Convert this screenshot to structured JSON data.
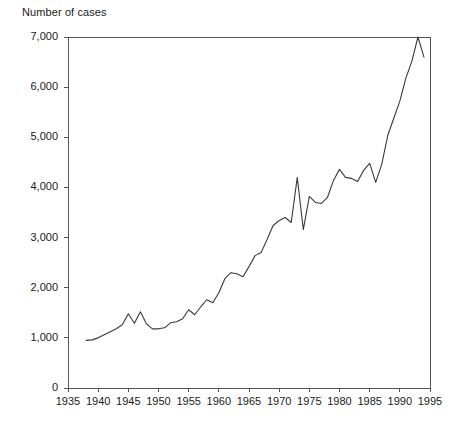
{
  "chart_data": {
    "type": "line",
    "title": "Number of cases",
    "xlabel": "",
    "ylabel": "Number of cases",
    "xlim": [
      1935,
      1995
    ],
    "ylim": [
      0,
      7000
    ],
    "grid": false,
    "legend": null,
    "x_ticks": [
      "1935",
      "1940",
      "1945",
      "1950",
      "1955",
      "1960",
      "1965",
      "1970",
      "1975",
      "1980",
      "1985",
      "1990",
      "1995"
    ],
    "y_ticks": [
      "0",
      "1,000",
      "2,000",
      "3,000",
      "4,000",
      "5,000",
      "6,000",
      "7,000"
    ],
    "series": [
      {
        "name": "Number of cases",
        "x": [
          1938,
          1939,
          1940,
          1941,
          1942,
          1943,
          1944,
          1945,
          1946,
          1947,
          1948,
          1949,
          1950,
          1951,
          1952,
          1953,
          1954,
          1955,
          1956,
          1957,
          1958,
          1959,
          1960,
          1961,
          1962,
          1963,
          1964,
          1965,
          1966,
          1967,
          1968,
          1969,
          1970,
          1971,
          1972,
          1973,
          1974,
          1975,
          1976,
          1977,
          1978,
          1979,
          1980,
          1981,
          1982,
          1983,
          1984,
          1985,
          1986,
          1987,
          1988,
          1989,
          1990,
          1991,
          1992,
          1993,
          1994
        ],
        "y": [
          950,
          960,
          1000,
          1060,
          1120,
          1180,
          1260,
          1480,
          1290,
          1520,
          1280,
          1180,
          1180,
          1200,
          1300,
          1320,
          1380,
          1560,
          1460,
          1620,
          1760,
          1700,
          1900,
          2180,
          2300,
          2280,
          2220,
          2420,
          2640,
          2700,
          2960,
          3240,
          3340,
          3400,
          3300,
          4200,
          3160,
          3820,
          3700,
          3680,
          3800,
          4140,
          4360,
          4200,
          4180,
          4120,
          4340,
          4480,
          4100,
          4460,
          5040,
          5380,
          5720,
          6180,
          6520,
          7000,
          6600
        ]
      }
    ]
  },
  "plot_geometry": {
    "left": 68,
    "right": 430,
    "top": 37,
    "bottom": 388
  }
}
